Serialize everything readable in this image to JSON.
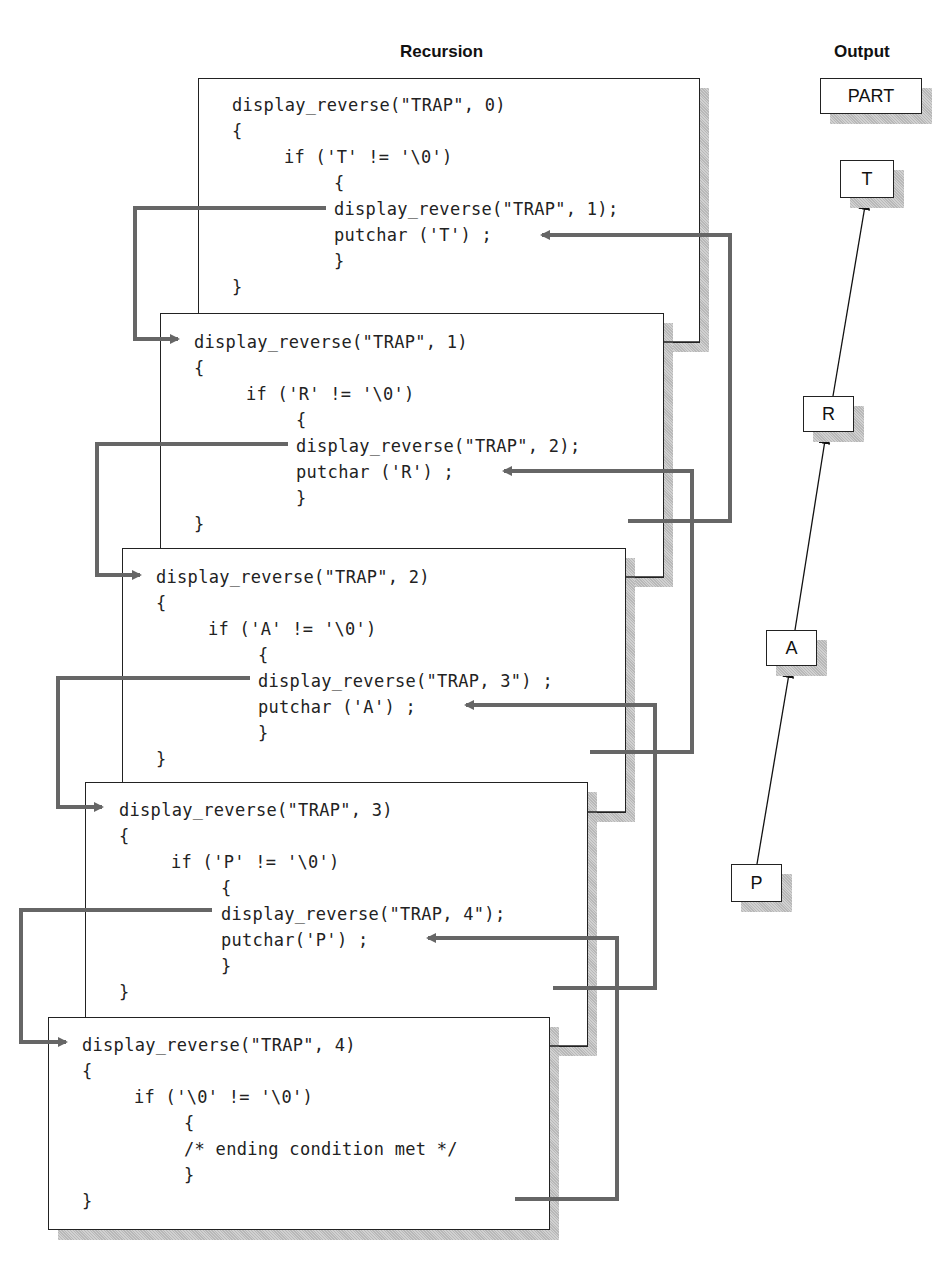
{
  "headings": {
    "recursion": "Recursion",
    "output": "Output"
  },
  "frames": [
    {
      "call": "display_reverse(\"TRAP\", 0)",
      "open_brace": "{",
      "condition": "if ('T' != '\\0')",
      "inner_open": "{",
      "recursive_call": "display_reverse(\"TRAP\", 1);",
      "putchar": "putchar ('T') ;",
      "inner_close": "}",
      "close_brace": "}"
    },
    {
      "call": "display_reverse(\"TRAP\", 1)",
      "open_brace": "{",
      "condition": "if ('R' != '\\0')",
      "inner_open": "{",
      "recursive_call": "display_reverse(\"TRAP\", 2);",
      "putchar": "putchar ('R') ;",
      "inner_close": "}",
      "close_brace": "}"
    },
    {
      "call": "display_reverse(\"TRAP\", 2)",
      "open_brace": "{",
      "condition": "if ('A' != '\\0')",
      "inner_open": "{",
      "recursive_call": "display_reverse(\"TRAP, 3\") ;",
      "putchar": "putchar ('A') ;",
      "inner_close": "}",
      "close_brace": "}"
    },
    {
      "call": "display_reverse(\"TRAP\", 3)",
      "open_brace": "{",
      "condition": "if ('P' != '\\0')",
      "inner_open": "{",
      "recursive_call": "display_reverse(\"TRAP, 4\");",
      "putchar": "putchar('P') ;",
      "inner_close": "}",
      "close_brace": "}"
    },
    {
      "call": "display_reverse(\"TRAP\", 4)",
      "open_brace": "{",
      "condition": "if ('\\0' != '\\0')",
      "inner_open": "{",
      "comment": "/* ending condition met */",
      "inner_close": "}",
      "close_brace": "}"
    }
  ],
  "output": {
    "result": "PART",
    "chars": [
      "T",
      "R",
      "A",
      "P"
    ]
  },
  "colors": {
    "frame_border": "#222222",
    "connector": "#666666",
    "shadow": "#b8b8b8",
    "output_arrow": "#111111"
  }
}
